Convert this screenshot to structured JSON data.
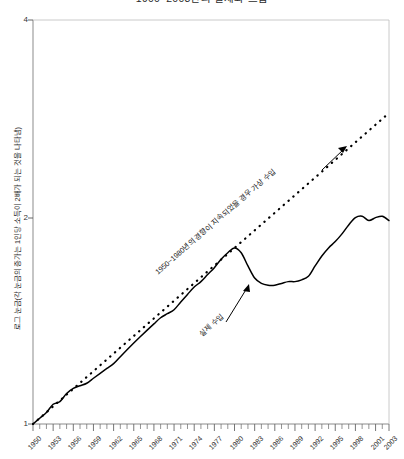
{
  "chart_data": {
    "type": "line",
    "title": "1900~2003년의 실제와 흐름",
    "xlabel": "",
    "ylabel": "로그 눈금(각 눈금의 증가는 1인당 소득이 2배가 되는 것을 나타냄)",
    "y_scale": "log2",
    "ylim": [
      1,
      4
    ],
    "yticks": [
      1,
      2,
      4
    ],
    "ytick_labels": [
      "1",
      "2",
      "4"
    ],
    "xlim": [
      1950,
      2003
    ],
    "xtick_labels": [
      "1950",
      "1953",
      "1956",
      "1959",
      "1962",
      "1965",
      "1968",
      "1971",
      "1974",
      "1977",
      "1980",
      "1983",
      "1986",
      "1989",
      "1992",
      "1995",
      "1998",
      "2001",
      "2003"
    ],
    "xticks": [
      1950,
      1953,
      1956,
      1959,
      1962,
      1965,
      1968,
      1971,
      1974,
      1977,
      1980,
      1983,
      1986,
      1989,
      1992,
      1995,
      1998,
      2001,
      2003
    ],
    "minor_tick_interval": 1,
    "grid": false,
    "legend": "none",
    "series": [
      {
        "name": "실제 수입",
        "style": "solid",
        "color": "#000000",
        "x": [
          1950,
          1951,
          1952,
          1953,
          1954,
          1955,
          1956,
          1957,
          1958,
          1959,
          1960,
          1961,
          1962,
          1963,
          1964,
          1965,
          1966,
          1967,
          1968,
          1969,
          1970,
          1971,
          1972,
          1973,
          1974,
          1975,
          1976,
          1977,
          1978,
          1979,
          1980,
          1981,
          1982,
          1983,
          1984,
          1985,
          1986,
          1987,
          1988,
          1989,
          1990,
          1991,
          1992,
          1993,
          1994,
          1995,
          1996,
          1997,
          1998,
          1999,
          2000,
          2001,
          2002,
          2003
        ],
        "values": [
          1.0,
          1.02,
          1.04,
          1.07,
          1.08,
          1.11,
          1.13,
          1.14,
          1.15,
          1.17,
          1.19,
          1.21,
          1.23,
          1.26,
          1.29,
          1.32,
          1.35,
          1.38,
          1.41,
          1.44,
          1.46,
          1.48,
          1.52,
          1.56,
          1.6,
          1.63,
          1.67,
          1.71,
          1.76,
          1.8,
          1.83,
          1.8,
          1.72,
          1.65,
          1.62,
          1.61,
          1.61,
          1.62,
          1.63,
          1.63,
          1.64,
          1.66,
          1.72,
          1.78,
          1.83,
          1.87,
          1.92,
          1.98,
          2.03,
          2.04,
          2.01,
          2.03,
          2.04,
          2.01
        ]
      },
      {
        "name": "1950~1980년의 경향이 지속되었을 경우 가상 수입",
        "style": "dotted",
        "color": "#000000",
        "x": [
          1950,
          2003
        ],
        "values": [
          1.0,
          3.32
        ]
      }
    ],
    "annotations": [
      {
        "id": "trend-label",
        "text": "1950~1980년의 경향이 지속되었을 경우 가상 수입",
        "target": "dotted-line",
        "arrow": true
      },
      {
        "id": "actual-label",
        "text": "실제 수입",
        "target": "solid-line",
        "arrow": true
      }
    ]
  }
}
